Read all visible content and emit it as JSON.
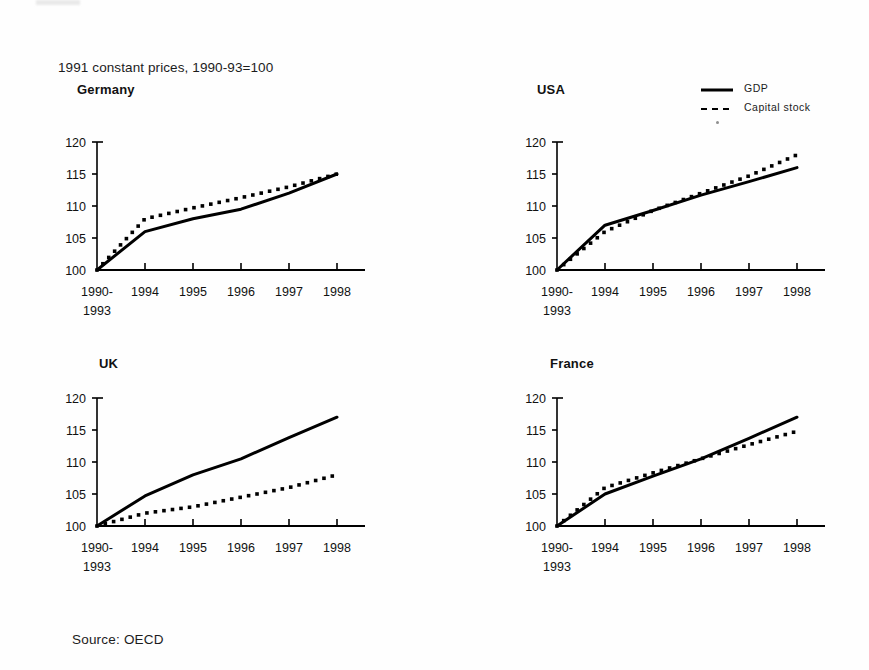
{
  "document": {
    "caption_top": "1991 constant prices, 1990-93=100",
    "source_note": "Source: OECD"
  },
  "legend": {
    "position": "top-right",
    "entries": [
      {
        "label": "GDP",
        "style": "solid",
        "color": "#000000"
      },
      {
        "label": "Capital stock",
        "style": "dashed",
        "color": "#000000"
      }
    ]
  },
  "axis": {
    "y_ticks": [
      "100",
      "105",
      "110",
      "115",
      "120"
    ],
    "y_min": 100,
    "y_max": 120,
    "x_categories": [
      "1990-\n1993",
      "1994",
      "1995",
      "1996",
      "1997",
      "1998"
    ],
    "x_tick_labels": [
      "1990-",
      "1994",
      "1995",
      "1996",
      "1997",
      "1998"
    ],
    "x_tick_label_second_line": "1993"
  },
  "chart_data": [
    {
      "type": "line",
      "title": "Germany",
      "xlabel": "",
      "ylabel": "",
      "ylim": [
        100,
        120
      ],
      "grid": false,
      "categories": [
        "1990-1993",
        "1994",
        "1995",
        "1996",
        "1997",
        "1998"
      ],
      "series": [
        {
          "name": "GDP",
          "style": "solid",
          "values": [
            100,
            106.0,
            108.0,
            109.5,
            112.0,
            115.0
          ]
        },
        {
          "name": "Capital stock",
          "style": "dashed",
          "values": [
            100,
            108.0,
            109.7,
            111.3,
            113.0,
            115.0
          ]
        }
      ]
    },
    {
      "type": "line",
      "title": "USA",
      "xlabel": "",
      "ylabel": "",
      "ylim": [
        100,
        120
      ],
      "grid": false,
      "categories": [
        "1990-1993",
        "1994",
        "1995",
        "1996",
        "1997",
        "1998"
      ],
      "series": [
        {
          "name": "GDP",
          "style": "solid",
          "values": [
            100,
            107.0,
            109.3,
            111.7,
            113.8,
            116.0
          ]
        },
        {
          "name": "Capital stock",
          "style": "dashed",
          "values": [
            100,
            106.0,
            109.3,
            112.0,
            114.7,
            118.0
          ]
        }
      ]
    },
    {
      "type": "line",
      "title": "UK",
      "xlabel": "",
      "ylabel": "",
      "ylim": [
        100,
        120
      ],
      "grid": false,
      "categories": [
        "1990-1993",
        "1994",
        "1995",
        "1996",
        "1997",
        "1998"
      ],
      "series": [
        {
          "name": "GDP",
          "style": "solid",
          "values": [
            100,
            104.7,
            108.0,
            110.5,
            113.8,
            117.0
          ]
        },
        {
          "name": "Capital stock",
          "style": "dashed",
          "values": [
            100,
            102.0,
            103.0,
            104.5,
            106.0,
            108.0
          ]
        }
      ]
    },
    {
      "type": "line",
      "title": "France",
      "xlabel": "",
      "ylabel": "",
      "ylim": [
        100,
        120
      ],
      "grid": false,
      "categories": [
        "1990-1993",
        "1994",
        "1995",
        "1996",
        "1997",
        "1998"
      ],
      "series": [
        {
          "name": "GDP",
          "style": "solid",
          "values": [
            100,
            105.0,
            107.8,
            110.5,
            113.7,
            117.0
          ]
        },
        {
          "name": "Capital stock",
          "style": "dashed",
          "values": [
            100,
            106.0,
            108.3,
            110.5,
            112.7,
            114.8
          ]
        }
      ]
    }
  ],
  "panels": [
    {
      "title": "Germany",
      "title_left": 77,
      "title_top": 82,
      "plot_left": 40,
      "plot_top": 120
    },
    {
      "title": "USA",
      "title_left": 537,
      "title_top": 82,
      "plot_left": 500,
      "plot_top": 120
    },
    {
      "title": "UK",
      "title_left": 99,
      "title_top": 356,
      "plot_left": 40,
      "plot_top": 376
    },
    {
      "title": "France",
      "title_left": 550,
      "title_top": 356,
      "plot_left": 500,
      "plot_top": 376
    }
  ]
}
